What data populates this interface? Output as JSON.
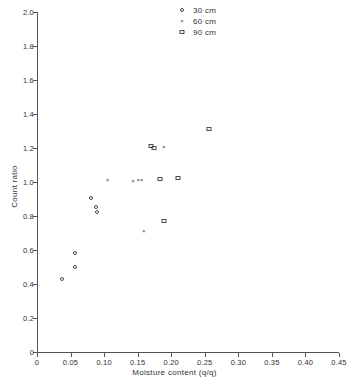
{
  "chart_data": {
    "type": "scatter",
    "title": "",
    "xlabel": "Moisture content (q/q)",
    "ylabel": "Count ratio",
    "xlim": [
      0,
      0.45
    ],
    "ylim": [
      0,
      2.0
    ],
    "xticks": [
      "0",
      "0.05",
      "0.10",
      "0.15",
      "0.20",
      "0.25",
      "0.30",
      "0.35",
      "0.40",
      "0.45"
    ],
    "xtick_values": [
      0,
      0.05,
      0.1,
      0.15,
      0.2,
      0.25,
      0.3,
      0.35,
      0.4,
      0.45
    ],
    "yticks": [
      "0",
      "0.2",
      "0.4",
      "0.6",
      "0.8",
      "1.0",
      "1.2",
      "1.4",
      "1.6",
      "1.8",
      "2.0"
    ],
    "ytick_values": [
      0,
      0.2,
      0.4,
      0.6,
      0.8,
      1.0,
      1.2,
      1.4,
      1.6,
      1.8,
      2.0
    ],
    "grid": false,
    "legend_position": "top-right",
    "series": [
      {
        "name": "30 cm",
        "marker": "circle",
        "color": "#4a4a4a",
        "points": [
          {
            "x": 0.037,
            "y": 0.43
          },
          {
            "x": 0.056,
            "y": 0.5
          },
          {
            "x": 0.056,
            "y": 0.585
          },
          {
            "x": 0.08,
            "y": 0.905
          },
          {
            "x": 0.088,
            "y": 0.855
          },
          {
            "x": 0.09,
            "y": 0.825
          }
        ]
      },
      {
        "name": "60 cm",
        "marker": "cross",
        "color": "#3a3a3a",
        "points": [
          {
            "x": 0.105,
            "y": 1.01
          },
          {
            "x": 0.143,
            "y": 1.005
          },
          {
            "x": 0.151,
            "y": 1.01
          },
          {
            "x": 0.156,
            "y": 1.01
          },
          {
            "x": 0.159,
            "y": 0.71
          },
          {
            "x": 0.189,
            "y": 1.205
          }
        ]
      },
      {
        "name": "90 cm",
        "marker": "square",
        "color": "#4a4a4a",
        "points": [
          {
            "x": 0.17,
            "y": 1.21
          },
          {
            "x": 0.175,
            "y": 1.2
          },
          {
            "x": 0.183,
            "y": 1.02
          },
          {
            "x": 0.189,
            "y": 0.77
          },
          {
            "x": 0.21,
            "y": 1.025
          },
          {
            "x": 0.256,
            "y": 1.31
          }
        ]
      }
    ]
  },
  "legend": {
    "items": [
      {
        "label": "30 cm",
        "marker": "circle"
      },
      {
        "label": "60 cm",
        "marker": "cross"
      },
      {
        "label": "90 cm",
        "marker": "square"
      }
    ]
  },
  "markers": {
    "cross_glyph": "×"
  }
}
